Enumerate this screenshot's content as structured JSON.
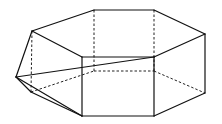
{
  "figure": {
    "stroke_color": "#111111",
    "vertices": {
      "T1": [
        32,
        31
      ],
      "T2": [
        94,
        10
      ],
      "T3": [
        154,
        10
      ],
      "T4": [
        205,
        34
      ],
      "T5": [
        154,
        57
      ],
      "T6": [
        82,
        57
      ],
      "L": [
        16,
        77
      ],
      "B1": [
        31,
        92
      ],
      "B2": [
        94,
        71
      ],
      "B3": [
        154,
        71
      ],
      "B4": [
        205,
        93
      ],
      "B5": [
        154,
        116
      ],
      "B6": [
        82,
        116
      ]
    },
    "solid_edges": [
      [
        "T1",
        "T2"
      ],
      [
        "T2",
        "T3"
      ],
      [
        "T3",
        "T4"
      ],
      [
        "T4",
        "T5"
      ],
      [
        "T5",
        "T6"
      ],
      [
        "T6",
        "T1"
      ],
      [
        "T1",
        "L"
      ],
      [
        "L",
        "T5"
      ],
      [
        "L",
        "B6"
      ],
      [
        "L",
        "B1"
      ],
      [
        "B1",
        "B6"
      ],
      [
        "T6",
        "B6"
      ],
      [
        "T5",
        "B5"
      ],
      [
        "T4",
        "B4"
      ],
      [
        "B6",
        "B5"
      ],
      [
        "B5",
        "B4"
      ]
    ],
    "hidden_edges": [
      [
        "T2",
        "B2"
      ],
      [
        "T3",
        "B3"
      ],
      [
        "T1",
        "B1"
      ],
      [
        "B1",
        "B2"
      ],
      [
        "B2",
        "B3"
      ],
      [
        "B3",
        "B4"
      ]
    ]
  }
}
